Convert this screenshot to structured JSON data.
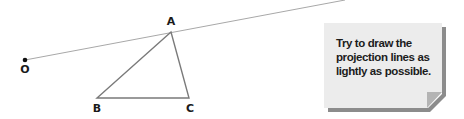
{
  "diagram": {
    "point_o": {
      "label": "O",
      "x": 25,
      "y": 60
    },
    "vertices": [
      {
        "label": "A",
        "x": 171,
        "y": 32,
        "label_x": 171,
        "label_y": 15
      },
      {
        "label": "B",
        "x": 97,
        "y": 98,
        "label_x": 97,
        "label_y": 103
      },
      {
        "label": "C",
        "x": 189,
        "y": 98,
        "label_x": 190,
        "label_y": 103
      }
    ],
    "projection_line": {
      "from": "O",
      "through": "A",
      "end_x": 345,
      "end_y": 0
    },
    "colors": {
      "triangle_stroke": "#7a7a7a",
      "projection_stroke": "#a8a8a8",
      "point": "#111111",
      "note_bg": "#ececec",
      "note_shadow": "#8c8c8c",
      "note_fold": "#b4b4b4"
    }
  },
  "note": {
    "text_lines": [
      "Try to draw the",
      "projection lines as",
      "lightly as possible."
    ]
  }
}
